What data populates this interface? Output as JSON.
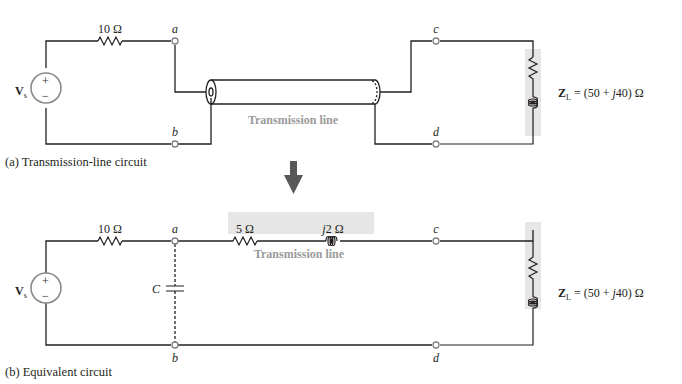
{
  "circuit_a": {
    "caption": "(a) Transmission-line circuit",
    "source_label": "V",
    "source_sub": "s",
    "source_plus": "+",
    "source_minus": "−",
    "resistor_label": "10 Ω",
    "node_a": "a",
    "node_b": "b",
    "node_c": "c",
    "node_d": "d",
    "tline_label": "Transmission line",
    "load_label_z": "Z",
    "load_label_sub": "L",
    "load_label_pre": " = (50 + ",
    "load_label_j": "j",
    "load_label_post": "40) Ω"
  },
  "arrow": {
    "direction": "down",
    "color": "#595959"
  },
  "circuit_b": {
    "caption": "(b) Equivalent circuit",
    "source_label": "V",
    "source_sub": "s",
    "source_plus": "+",
    "source_minus": "−",
    "resistor_label": "10 Ω",
    "node_a": "a",
    "node_b": "b",
    "node_c": "c",
    "node_d": "d",
    "capacitor_label": "C",
    "tline_resistor_label": "5 Ω",
    "tline_inductor_j": "j",
    "tline_inductor_label": "2 Ω",
    "tline_label": "Transmission line",
    "load_label_z": "Z",
    "load_label_sub": "L",
    "load_label_pre": " = (50 + ",
    "load_label_j": "j",
    "load_label_post": "40) Ω"
  },
  "colors": {
    "wire": "#231f20",
    "terminal": "#808080",
    "shade": "#e6e6e6",
    "tline_text": "#9a9a9a"
  }
}
